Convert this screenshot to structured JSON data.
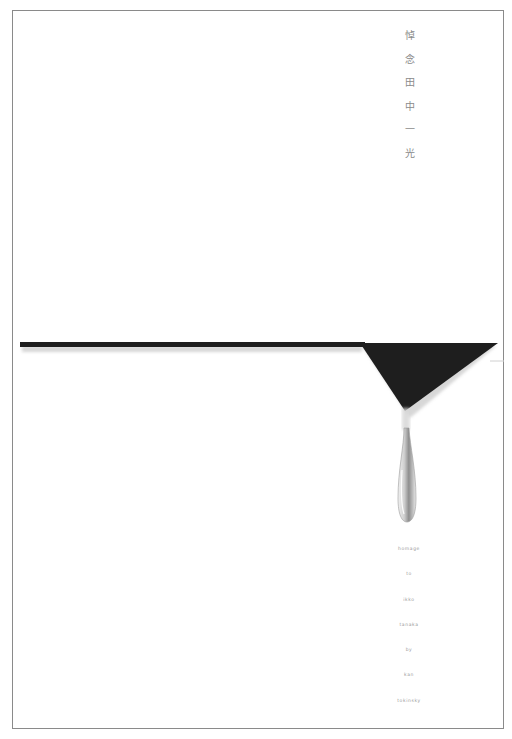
{
  "poster": {
    "title_vertical": [
      "悼",
      "念",
      "田",
      "中",
      "一",
      "光"
    ],
    "credits": [
      "homage",
      "to",
      "ikko",
      "tanaka",
      "by",
      "kan",
      "tokinsky"
    ],
    "colors": {
      "background": "#ffffff",
      "frame": "#8a8a8a",
      "bar": "#1e1e1e",
      "shadow": "#b5b5b5",
      "text": "#8a8a8a"
    }
  }
}
